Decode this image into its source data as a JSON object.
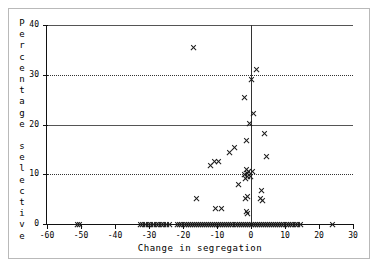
{
  "chart_data": {
    "type": "scatter",
    "title": "",
    "xlabel": "Change in segregation",
    "ylabel": "Percentage selective",
    "ylabel_letters": [
      "P",
      "e",
      "r",
      "c",
      "e",
      "n",
      "t",
      "a",
      "g",
      "e",
      "",
      "s",
      "e",
      "l",
      "e",
      "c",
      "t",
      "i",
      "v",
      "e"
    ],
    "xlim": [
      -60,
      30
    ],
    "ylim": [
      0,
      40
    ],
    "xticks": [
      -60,
      -50,
      -40,
      -30,
      -20,
      -10,
      0,
      10,
      20,
      30
    ],
    "xticklabels": [
      "-60",
      "-50",
      "-40",
      "-30",
      "-20",
      "-10",
      "0",
      "10",
      "20",
      "30"
    ],
    "yticks": [
      0,
      10,
      20,
      30,
      40
    ],
    "yticklabels": [
      "0",
      "10",
      "20",
      "30",
      "40"
    ],
    "grid": "horizontal-dotted",
    "legend": "none",
    "marker": "x",
    "marker_color": "#1a1a1a",
    "reference_lines": [
      {
        "axis": "x",
        "value": 0,
        "style": "solid"
      }
    ],
    "points": [
      [
        -51.0,
        0.0
      ],
      [
        -50.3,
        0.0
      ],
      [
        -32.6,
        0.0
      ],
      [
        -31.8,
        0.0
      ],
      [
        -31.0,
        0.0
      ],
      [
        -30.2,
        0.0
      ],
      [
        -29.5,
        0.0
      ],
      [
        -28.7,
        0.0
      ],
      [
        -27.9,
        0.0
      ],
      [
        -27.1,
        0.0
      ],
      [
        -26.4,
        0.0
      ],
      [
        -25.6,
        0.0
      ],
      [
        -24.8,
        0.0
      ],
      [
        -24.0,
        0.0
      ],
      [
        -21.5,
        0.0
      ],
      [
        -20.9,
        0.0
      ],
      [
        -20.3,
        0.0
      ],
      [
        -19.7,
        0.0
      ],
      [
        -19.1,
        0.0
      ],
      [
        -18.5,
        0.0
      ],
      [
        -17.9,
        0.0
      ],
      [
        -17.3,
        0.0
      ],
      [
        -16.7,
        0.0
      ],
      [
        -16.1,
        0.0
      ],
      [
        -15.5,
        0.0
      ],
      [
        -14.9,
        0.0
      ],
      [
        -14.3,
        0.0
      ],
      [
        -13.7,
        0.0
      ],
      [
        -13.1,
        0.0
      ],
      [
        -12.5,
        0.0
      ],
      [
        -11.9,
        0.0
      ],
      [
        -11.3,
        0.0
      ],
      [
        -10.7,
        0.0
      ],
      [
        -10.1,
        0.0
      ],
      [
        -9.5,
        0.0
      ],
      [
        -8.9,
        0.0
      ],
      [
        -8.3,
        0.0
      ],
      [
        -7.7,
        0.0
      ],
      [
        -7.1,
        0.0
      ],
      [
        -6.5,
        0.0
      ],
      [
        -5.9,
        0.0
      ],
      [
        -5.3,
        0.0
      ],
      [
        -4.7,
        0.0
      ],
      [
        -4.1,
        0.0
      ],
      [
        -3.5,
        0.0
      ],
      [
        -2.9,
        0.0
      ],
      [
        -2.3,
        0.0
      ],
      [
        -1.7,
        0.0
      ],
      [
        -1.1,
        0.0
      ],
      [
        -0.5,
        0.0
      ],
      [
        0.1,
        0.0
      ],
      [
        0.7,
        0.0
      ],
      [
        1.3,
        0.0
      ],
      [
        1.9,
        0.0
      ],
      [
        2.5,
        0.0
      ],
      [
        3.1,
        0.0
      ],
      [
        3.7,
        0.0
      ],
      [
        4.3,
        0.0
      ],
      [
        4.9,
        0.0
      ],
      [
        5.5,
        0.0
      ],
      [
        6.1,
        0.0
      ],
      [
        6.7,
        0.0
      ],
      [
        7.3,
        0.0
      ],
      [
        7.9,
        0.0
      ],
      [
        8.5,
        0.0
      ],
      [
        9.1,
        0.0
      ],
      [
        9.7,
        0.0
      ],
      [
        10.3,
        0.0
      ],
      [
        10.9,
        0.0
      ],
      [
        11.6,
        0.0
      ],
      [
        12.3,
        0.0
      ],
      [
        13.0,
        0.0
      ],
      [
        13.8,
        0.0
      ],
      [
        14.6,
        0.0
      ],
      [
        23.9,
        0.0
      ],
      [
        -17.0,
        35.5
      ],
      [
        1.6,
        31.0
      ],
      [
        0.0,
        29.0
      ],
      [
        -1.9,
        25.5
      ],
      [
        0.6,
        22.3
      ],
      [
        -0.3,
        20.2
      ],
      [
        4.0,
        18.2
      ],
      [
        -1.2,
        16.8
      ],
      [
        -5.0,
        15.4
      ],
      [
        -6.3,
        14.3
      ],
      [
        4.6,
        13.6
      ],
      [
        -10.7,
        12.6
      ],
      [
        -9.6,
        12.5
      ],
      [
        -12.0,
        11.8
      ],
      [
        -1.4,
        10.9
      ],
      [
        -0.7,
        10.6
      ],
      [
        0.3,
        10.5
      ],
      [
        -0.9,
        10.1
      ],
      [
        -1.8,
        9.9
      ],
      [
        -1.1,
        9.6
      ],
      [
        -0.2,
        9.5
      ],
      [
        -1.5,
        9.1
      ],
      [
        -3.6,
        7.9
      ],
      [
        3.2,
        6.8
      ],
      [
        -1.0,
        5.6
      ],
      [
        -1.6,
        5.2
      ],
      [
        2.8,
        5.1
      ],
      [
        3.5,
        4.7
      ],
      [
        -16.0,
        5.2
      ],
      [
        -10.4,
        3.1
      ],
      [
        -8.6,
        3.1
      ],
      [
        -1.3,
        2.6
      ],
      [
        -1.0,
        2.1
      ]
    ]
  }
}
